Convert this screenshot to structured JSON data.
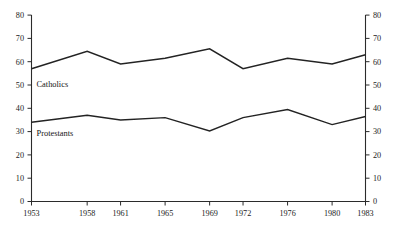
{
  "chart_data": {
    "type": "line",
    "title": "",
    "subtitle": "",
    "xlabel": "",
    "ylabel": "",
    "categories": [
      "1953",
      "1958",
      "1961",
      "1965",
      "1969",
      "1972",
      "1976",
      "1980",
      "1983"
    ],
    "x_tick_labels": [
      "1953",
      "1958",
      "1961",
      "1965",
      "1969",
      "1972",
      "1976",
      "1980",
      "1983"
    ],
    "y_tick_labels": [
      "0",
      "10",
      "20",
      "30",
      "40",
      "50",
      "60",
      "70",
      "80"
    ],
    "y_tick_values": [
      0,
      10,
      20,
      30,
      40,
      50,
      60,
      70,
      80
    ],
    "ylim": [
      0,
      80
    ],
    "y_axis_right": true,
    "y_right_tick_labels": [
      "0",
      "10",
      "20",
      "30",
      "40",
      "50",
      "60",
      "70",
      "80"
    ],
    "grid": false,
    "legend_position": "inline-labels",
    "series": [
      {
        "name": "Catholics",
        "label": "Catholics",
        "color": "#232323",
        "values": [
          57,
          64.5,
          59,
          61.5,
          65.5,
          57,
          61.5,
          59,
          63
        ]
      },
      {
        "name": "Protestants",
        "label": "Protestants",
        "color": "#232323",
        "values": [
          34,
          37,
          35,
          36,
          30.3,
          36,
          39.5,
          33,
          36.5
        ]
      }
    ],
    "annotations": [
      {
        "text": "Catholics",
        "x": "1953",
        "y": 50.5
      },
      {
        "text": "Protestants",
        "x": "1953",
        "y": 29.5
      }
    ]
  },
  "axes": {
    "left_axis_name": "left-value-axis",
    "right_axis_name": "right-value-axis",
    "bottom_axis_name": "year-axis"
  }
}
